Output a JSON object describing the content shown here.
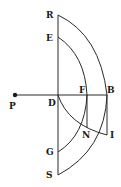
{
  "diagram": {
    "labels": {
      "R": "R",
      "E": "E",
      "P": "P",
      "D": "D",
      "F": "F",
      "B": "B",
      "N": "N",
      "I": "I",
      "G": "G",
      "S": "S"
    },
    "colors": {
      "line": "#2a2a2a",
      "background": "#ffffff"
    }
  }
}
